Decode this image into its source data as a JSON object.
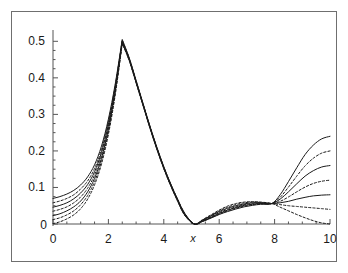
{
  "chart_data": {
    "type": "line",
    "title": "",
    "subtitle": "",
    "xlabel": "x",
    "ylabel": "",
    "xlim": [
      0,
      10
    ],
    "ylim": [
      0,
      0.52
    ],
    "grid": false,
    "legend": null,
    "legend_position": "none",
    "xticks": [
      0,
      2,
      4,
      6,
      8,
      10
    ],
    "xtick_labels": [
      "0",
      "2",
      "4",
      "6",
      "8",
      "10"
    ],
    "yticks": [
      0,
      0.1,
      0.2,
      0.3,
      0.4,
      0.5
    ],
    "ytick_labels": [
      "0",
      "0.1",
      "0.2",
      "0.3",
      "0.4",
      "0.5"
    ],
    "xminor_step": 0.5,
    "yminor_step": 0.025,
    "annotations": [
      {
        "text": "cusp peak",
        "x": 2.5,
        "y": 0.51
      },
      {
        "text": "zero minimum",
        "x": 5.1,
        "y": 0.0
      },
      {
        "text": "fan crossing node",
        "x": 7.9,
        "y": 0.055
      }
    ],
    "x": [
      0.0,
      0.25,
      0.5,
      0.75,
      1.0,
      1.25,
      1.5,
      1.75,
      2.0,
      2.25,
      2.5,
      2.75,
      3.0,
      3.25,
      3.5,
      3.75,
      4.0,
      4.25,
      4.5,
      4.75,
      5.1,
      5.4,
      5.7,
      6.0,
      6.3,
      6.6,
      6.9,
      7.2,
      7.5,
      7.9,
      8.2,
      8.5,
      8.8,
      9.1,
      9.4,
      9.7,
      10.0
    ],
    "series": [
      {
        "name": "curve-1",
        "style": "solid",
        "color": "#1a1a1a",
        "values": [
          0.07,
          0.075,
          0.082,
          0.092,
          0.107,
          0.129,
          0.162,
          0.213,
          0.287,
          0.385,
          0.505,
          0.455,
          0.393,
          0.33,
          0.268,
          0.21,
          0.157,
          0.11,
          0.068,
          0.03,
          0.0,
          0.007,
          0.016,
          0.026,
          0.034,
          0.041,
          0.047,
          0.051,
          0.054,
          0.056,
          0.08,
          0.116,
          0.154,
          0.19,
          0.216,
          0.233,
          0.24
        ]
      },
      {
        "name": "curve-2",
        "style": "dashed",
        "color": "#1a1a1a",
        "values": [
          0.058,
          0.063,
          0.07,
          0.08,
          0.096,
          0.118,
          0.152,
          0.204,
          0.28,
          0.38,
          0.503,
          0.454,
          0.392,
          0.329,
          0.267,
          0.209,
          0.156,
          0.109,
          0.067,
          0.029,
          0.0,
          0.007,
          0.017,
          0.027,
          0.036,
          0.043,
          0.049,
          0.053,
          0.055,
          0.056,
          0.073,
          0.101,
          0.131,
          0.159,
          0.18,
          0.194,
          0.2
        ]
      },
      {
        "name": "curve-3",
        "style": "solid",
        "color": "#1a1a1a",
        "values": [
          0.046,
          0.051,
          0.058,
          0.069,
          0.085,
          0.108,
          0.143,
          0.196,
          0.273,
          0.375,
          0.501,
          0.452,
          0.39,
          0.328,
          0.266,
          0.208,
          0.155,
          0.108,
          0.066,
          0.028,
          0.0,
          0.008,
          0.018,
          0.029,
          0.038,
          0.045,
          0.051,
          0.054,
          0.056,
          0.056,
          0.068,
          0.088,
          0.11,
          0.131,
          0.146,
          0.156,
          0.16
        ]
      },
      {
        "name": "curve-4",
        "style": "dashed",
        "color": "#1a1a1a",
        "values": [
          0.035,
          0.04,
          0.047,
          0.058,
          0.074,
          0.098,
          0.134,
          0.188,
          0.266,
          0.37,
          0.499,
          0.451,
          0.389,
          0.327,
          0.265,
          0.207,
          0.154,
          0.107,
          0.065,
          0.027,
          0.0,
          0.009,
          0.02,
          0.031,
          0.04,
          0.047,
          0.053,
          0.056,
          0.057,
          0.056,
          0.062,
          0.074,
          0.088,
          0.101,
          0.111,
          0.117,
          0.12
        ]
      },
      {
        "name": "curve-5",
        "style": "solid",
        "color": "#1a1a1a",
        "values": [
          0.023,
          0.028,
          0.036,
          0.047,
          0.063,
          0.088,
          0.125,
          0.18,
          0.259,
          0.365,
          0.497,
          0.45,
          0.388,
          0.326,
          0.264,
          0.206,
          0.153,
          0.106,
          0.064,
          0.026,
          0.0,
          0.01,
          0.022,
          0.034,
          0.043,
          0.05,
          0.055,
          0.058,
          0.058,
          0.056,
          0.058,
          0.062,
          0.068,
          0.073,
          0.077,
          0.079,
          0.08
        ]
      },
      {
        "name": "curve-6",
        "style": "dashed",
        "color": "#1a1a1a",
        "values": [
          0.012,
          0.017,
          0.025,
          0.036,
          0.053,
          0.078,
          0.116,
          0.172,
          0.252,
          0.36,
          0.495,
          0.448,
          0.387,
          0.325,
          0.263,
          0.205,
          0.152,
          0.105,
          0.063,
          0.025,
          0.0,
          0.011,
          0.023,
          0.036,
          0.046,
          0.053,
          0.058,
          0.06,
          0.059,
          0.056,
          0.053,
          0.05,
          0.048,
          0.046,
          0.044,
          0.042,
          0.04
        ]
      },
      {
        "name": "curve-7",
        "style": "dashed",
        "color": "#1a1a1a",
        "values": [
          0.001,
          0.006,
          0.014,
          0.025,
          0.042,
          0.068,
          0.107,
          0.164,
          0.245,
          0.355,
          0.493,
          0.447,
          0.386,
          0.324,
          0.262,
          0.204,
          0.151,
          0.104,
          0.062,
          0.024,
          0.0,
          0.012,
          0.025,
          0.038,
          0.049,
          0.056,
          0.06,
          0.061,
          0.06,
          0.056,
          0.046,
          0.036,
          0.026,
          0.017,
          0.009,
          0.003,
          0.0
        ]
      }
    ]
  },
  "style": {
    "axis_color": "#555555",
    "curve_color": "#1a1a1a",
    "frame_color": "#6f6f6f",
    "background": "#ffffff",
    "text_color": "#1a1a1a"
  }
}
